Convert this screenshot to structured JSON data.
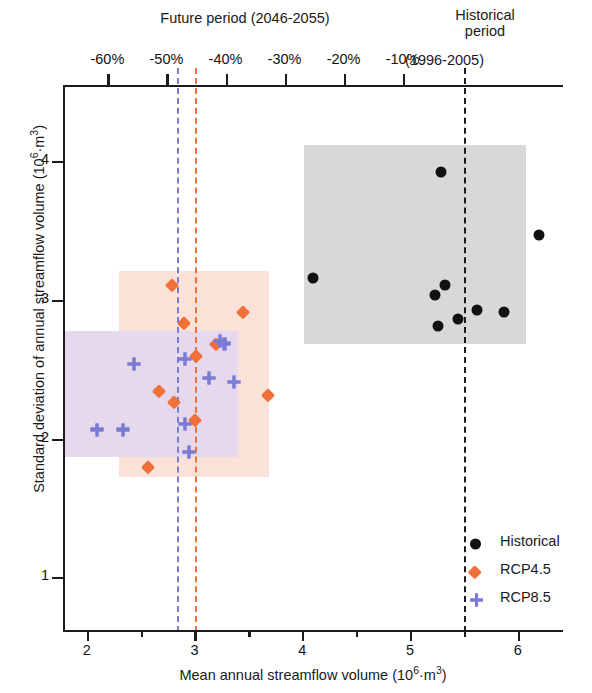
{
  "figure": {
    "x_axis": {
      "title_main": "Mean annual streamflow volume (10",
      "title_sup1": "6",
      "title_mid": "·m",
      "title_sup2": "3",
      "title_end": ")",
      "title_plain": "Mean annual streamflow volume (10^6·m^3)",
      "ticks": [
        "2",
        "3",
        "4",
        "5",
        "6"
      ],
      "range": [
        1.78,
        6.42
      ],
      "minor_step": 0.5
    },
    "y_axis": {
      "title_main": "Standard deviation of annual streamflow volume (10",
      "title_sup1": "6",
      "title_mid": "·m",
      "title_sup2": "3",
      "title_end": ")",
      "title_plain": "Standard deviation of annual streamflow volume (10^6·m^3)",
      "ticks": [
        "1",
        "2",
        "3",
        "4"
      ],
      "range": [
        0.62,
        4.55
      ]
    },
    "top_axis": {
      "ticks": [
        "-60%",
        "-50%",
        "-40%",
        "-30%",
        "-20%",
        "-10%"
      ],
      "tick_values": [
        -60,
        -50,
        -40,
        -30,
        -20,
        -10
      ]
    },
    "annotations": [
      {
        "name": "future-period",
        "lines": [
          "Future period (2046-2055)"
        ]
      },
      {
        "name": "historical-period",
        "lines": [
          "Historical",
          "period",
          "(1996-2005)"
        ]
      }
    ],
    "legend": {
      "items": [
        {
          "label": "Historical",
          "marker": "circle",
          "color": "#111111"
        },
        {
          "label": "RCP4.5",
          "marker": "diamond",
          "color": "#ef7038"
        },
        {
          "label": "RCP8.5",
          "marker": "plus",
          "color": "#7b7bd4"
        }
      ]
    },
    "colors": {
      "historical": "#111111",
      "rcp45": "#ef7038",
      "rcp85": "#7b7bd4",
      "band_historical": "#d8d8d8",
      "band_rcp45": "#fbe2d8",
      "band_rcp85": "#e6d9ee",
      "axis": "#1b1b1b"
    }
  },
  "chart_data": {
    "type": "scatter",
    "title": "",
    "xlabel": "Mean annual streamflow volume (10^6·m^3)",
    "ylabel": "Standard deviation of annual streamflow volume (10^6·m^3)",
    "xlim": [
      1.78,
      6.42
    ],
    "ylim": [
      0.62,
      4.55
    ],
    "xticks": [
      2,
      3,
      4,
      5,
      6
    ],
    "yticks": [
      1,
      2,
      3,
      4
    ],
    "top_axis_label": "Change in mean annual streamflow volume (%)",
    "top_axis_ticks": [
      -60,
      -50,
      -40,
      -30,
      -20,
      -10
    ],
    "grid": false,
    "legend_position": "lower right",
    "series": [
      {
        "name": "Historical",
        "marker": "circle",
        "color": "#111111",
        "points": [
          [
            5.27,
            3.94
          ],
          [
            6.18,
            3.48
          ],
          [
            4.08,
            3.17
          ],
          [
            5.31,
            3.12
          ],
          [
            5.21,
            3.05
          ],
          [
            5.24,
            2.83
          ],
          [
            5.43,
            2.88
          ],
          [
            5.6,
            2.94
          ],
          [
            5.85,
            2.93
          ]
        ]
      },
      {
        "name": "RCP4.5",
        "marker": "diamond",
        "color": "#ef7038",
        "points": [
          [
            2.77,
            3.12
          ],
          [
            3.43,
            2.93
          ],
          [
            2.88,
            2.85
          ],
          [
            3.18,
            2.7
          ],
          [
            3.0,
            2.61
          ],
          [
            2.65,
            2.36
          ],
          [
            2.79,
            2.28
          ],
          [
            2.99,
            2.15
          ],
          [
            3.66,
            2.33
          ],
          [
            2.55,
            1.81
          ]
        ]
      },
      {
        "name": "RCP8.5",
        "marker": "plus",
        "color": "#7b7bd4",
        "points": [
          [
            3.22,
            2.72
          ],
          [
            3.26,
            2.7
          ],
          [
            2.89,
            2.59
          ],
          [
            3.12,
            2.45
          ],
          [
            3.35,
            2.42
          ],
          [
            2.42,
            2.55
          ],
          [
            2.89,
            2.12
          ],
          [
            2.93,
            1.92
          ],
          [
            2.08,
            2.08
          ],
          [
            2.32,
            2.08
          ]
        ]
      }
    ],
    "bands": [
      {
        "name": "Historical range",
        "color": "#d8d8d8",
        "x_range": [
          4.0,
          6.06
        ],
        "y_range": [
          2.7,
          4.13
        ]
      },
      {
        "name": "RCP4.5 range",
        "color": "#fbe2d8",
        "x_range": [
          2.28,
          3.67
        ],
        "y_range": [
          1.74,
          3.22
        ]
      },
      {
        "name": "RCP8.5 range",
        "color": "#e6d9ee",
        "x_range": [
          1.78,
          3.39
        ],
        "y_range": [
          1.88,
          2.79
        ]
      }
    ],
    "reference_lines": [
      {
        "name": "Historical mean",
        "x": 5.48,
        "color": "#1b1b1b",
        "style": "dashed"
      },
      {
        "name": "RCP4.5 mean",
        "x": 2.99,
        "color": "#ef7038",
        "style": "dashed"
      },
      {
        "name": "RCP8.5 mean",
        "x": 2.82,
        "color": "#7b7bd4",
        "style": "dashed"
      }
    ]
  }
}
